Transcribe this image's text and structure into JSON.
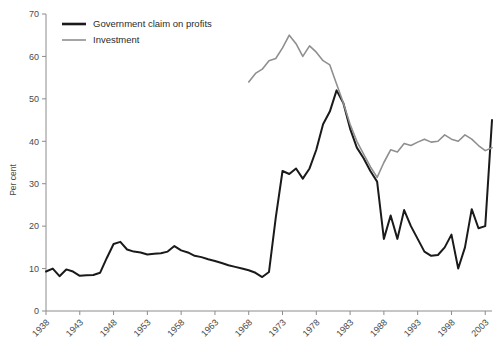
{
  "chart_data": {
    "type": "line",
    "title": "",
    "xlabel": "",
    "ylabel": "Per cent",
    "ylim": [
      0,
      70
    ],
    "yticks": [
      0,
      10,
      20,
      30,
      40,
      50,
      60,
      70
    ],
    "xlim": [
      1938,
      2004
    ],
    "xticks": [
      1938,
      1943,
      1948,
      1953,
      1958,
      1963,
      1968,
      1973,
      1978,
      1983,
      1988,
      1993,
      1998,
      2003
    ],
    "xtick_labels": [
      "1938",
      "1943",
      "1948",
      "1953",
      "1958",
      "1963",
      "1968",
      "1973",
      "1978",
      "1983",
      "1988",
      "1993",
      "1998",
      "2003"
    ],
    "grid": false,
    "legend_position": "top-left",
    "series": [
      {
        "name": "Government claim on profits",
        "color": "#1a1a1a",
        "width": 2.0,
        "x": [
          1938,
          1939,
          1940,
          1941,
          1942,
          1943,
          1944,
          1945,
          1946,
          1947,
          1948,
          1949,
          1950,
          1951,
          1952,
          1953,
          1954,
          1955,
          1956,
          1957,
          1958,
          1959,
          1960,
          1961,
          1962,
          1963,
          1964,
          1965,
          1966,
          1967,
          1968,
          1969,
          1970,
          1971,
          1972,
          1973,
          1974,
          1975,
          1976,
          1977,
          1978,
          1979,
          1980,
          1981,
          1982,
          1983,
          1984,
          1985,
          1986,
          1987,
          1988,
          1989,
          1990,
          1991,
          1992,
          1993,
          1994,
          1995,
          1996,
          1997,
          1998,
          1999,
          2000,
          2001,
          2002,
          2003,
          2004
        ],
        "y": [
          9.3,
          10.0,
          8.2,
          9.8,
          9.3,
          8.3,
          8.4,
          8.5,
          9.0,
          12.5,
          15.8,
          16.3,
          14.5,
          14.0,
          13.8,
          13.3,
          13.5,
          13.6,
          14.0,
          15.3,
          14.3,
          13.8,
          13.0,
          12.7,
          12.2,
          11.8,
          11.3,
          10.8,
          10.4,
          10.0,
          9.6,
          9.0,
          8.0,
          9.2,
          22.0,
          33.0,
          32.3,
          33.6,
          31.2,
          33.6,
          38.0,
          44.0,
          47.0,
          52.0,
          49.0,
          43.0,
          38.5,
          36.0,
          33.0,
          30.5,
          17.0,
          22.5,
          17.0,
          23.8,
          20.0,
          17.0,
          14.0,
          13.0,
          13.2,
          15.0,
          18.0,
          10.0,
          15.0,
          24.0,
          19.5,
          20.0,
          45.0
        ]
      },
      {
        "name": "Investment",
        "color": "#8f8f8f",
        "width": 1.6,
        "x": [
          1968,
          1969,
          1970,
          1971,
          1972,
          1973,
          1974,
          1975,
          1976,
          1977,
          1978,
          1979,
          1980,
          1981,
          1982,
          1983,
          1984,
          1985,
          1986,
          1987,
          1988,
          1989,
          1990,
          1991,
          1992,
          1993,
          1994,
          1995,
          1996,
          1997,
          1998,
          1999,
          2000,
          2001,
          2002,
          2003,
          2004
        ],
        "y": [
          54.0,
          56.0,
          57.0,
          59.0,
          59.5,
          62.0,
          65.0,
          63.0,
          60.0,
          62.5,
          61.0,
          59.0,
          58.0,
          53.5,
          49.0,
          44.0,
          40.0,
          37.0,
          34.0,
          31.5,
          35.0,
          38.0,
          37.5,
          39.5,
          39.0,
          39.8,
          40.5,
          39.8,
          40.0,
          41.5,
          40.5,
          40.0,
          41.5,
          40.5,
          39.0,
          37.8,
          38.5
        ]
      }
    ]
  },
  "legend": {
    "entries": [
      {
        "label": "Government claim on profits",
        "color": "#1a1a1a"
      },
      {
        "label": "Investment",
        "color": "#8f8f8f"
      }
    ]
  },
  "axis": {
    "y_title": "Per cent"
  }
}
